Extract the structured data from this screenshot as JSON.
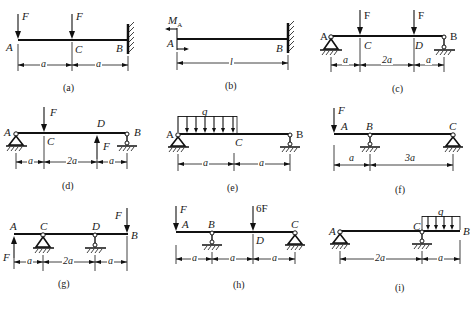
{
  "figure": {
    "panels": [
      {
        "id": "a",
        "caption": "(a)",
        "points": [
          "A",
          "C",
          "B"
        ],
        "loads": [
          "F",
          "F"
        ],
        "dims": [
          "a",
          "a"
        ],
        "support": "fixed wall at B"
      },
      {
        "id": "b",
        "caption": "(b)",
        "points": [
          "A",
          "B"
        ],
        "loads": [
          "M_A"
        ],
        "moment_label": "M",
        "moment_sub": "A",
        "dims": [
          "l"
        ],
        "support": "fixed wall at B"
      },
      {
        "id": "c",
        "caption": "(c)",
        "points": [
          "A",
          "C",
          "D",
          "B"
        ],
        "loads": [
          "F",
          "F"
        ],
        "dims": [
          "a",
          "2a",
          "a"
        ],
        "support": "pin at A, roller at B"
      },
      {
        "id": "d",
        "caption": "(d)",
        "points": [
          "A",
          "C",
          "D",
          "B"
        ],
        "loads": [
          "F",
          "F"
        ],
        "dims": [
          "a",
          "2a",
          "a"
        ],
        "support": "pin at A, roller at B"
      },
      {
        "id": "e",
        "caption": "(e)",
        "points": [
          "A",
          "C",
          "B"
        ],
        "loads": [
          "q"
        ],
        "dims": [
          "a",
          "a"
        ],
        "support": "pin at A, roller at B"
      },
      {
        "id": "f",
        "caption": "(f)",
        "points": [
          "A",
          "B",
          "C"
        ],
        "loads": [
          "F"
        ],
        "dims": [
          "a",
          "3a"
        ],
        "support": "roller at B, pin at C"
      },
      {
        "id": "g",
        "caption": "(g)",
        "points": [
          "A",
          "C",
          "D",
          "B"
        ],
        "loads": [
          "F",
          "F"
        ],
        "dims": [
          "a",
          "2a",
          "a"
        ],
        "support": "pin at C, roller at D"
      },
      {
        "id": "h",
        "caption": "(h)",
        "points": [
          "A",
          "B",
          "D",
          "C"
        ],
        "loads": [
          "F",
          "6F"
        ],
        "dims": [
          "a",
          "a",
          "a"
        ],
        "support": "roller at B, pin at C"
      },
      {
        "id": "i",
        "caption": "(i)",
        "points": [
          "A",
          "C",
          "B"
        ],
        "loads": [
          "q"
        ],
        "dims": [
          "2a",
          "a"
        ],
        "support": "pin at A, roller at C"
      }
    ]
  }
}
